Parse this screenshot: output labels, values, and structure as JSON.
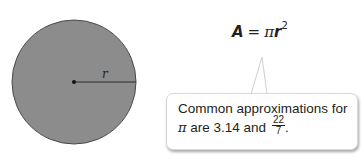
{
  "diagram": {
    "circle": {
      "center": [
        74,
        82
      ],
      "radius": 62,
      "fill": "#8c8c8c",
      "stroke": "#4a4a4a",
      "radius_label": "r"
    },
    "formula": {
      "lhs": "A",
      "equals": "=",
      "pi": "π",
      "var": "r",
      "exponent": "2"
    },
    "callout": {
      "line1": "Common approximations for",
      "line2_pi": "π",
      "line2_text": " are 3.14 and ",
      "fraction_numerator": "22",
      "fraction_denominator": "7",
      "line2_end": "."
    }
  }
}
